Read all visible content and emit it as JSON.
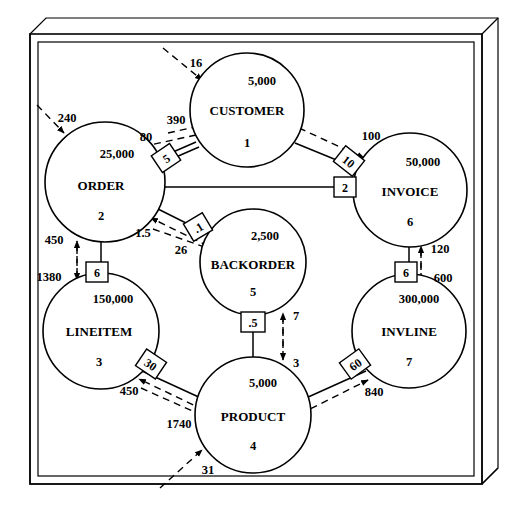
{
  "diagram": {
    "type": "entity-relationship-volume-diagram",
    "nodes": [
      {
        "id": "customer",
        "name": "CUSTOMER",
        "count": "5,000",
        "number": "1",
        "cx": 247,
        "cy": 110,
        "r": 57
      },
      {
        "id": "order",
        "name": "ORDER",
        "count": "25,000",
        "number": "2",
        "cx": 105,
        "cy": 182,
        "r": 60
      },
      {
        "id": "invoice",
        "name": "INVOICE",
        "count": "50,000",
        "number": "6",
        "cx": 410,
        "cy": 190,
        "r": 57
      },
      {
        "id": "backorder",
        "name": "BACKORDER",
        "count": "2,500",
        "number": "5",
        "cx": 253,
        "cy": 262,
        "r": 53
      },
      {
        "id": "lineitem",
        "name": "LINEITEM",
        "count": "150,000",
        "number": "3",
        "cx": 101,
        "cy": 331,
        "r": 58
      },
      {
        "id": "invline",
        "name": "INVLINE",
        "count": "300,000",
        "number": "7",
        "cx": 409,
        "cy": 331,
        "r": 57
      },
      {
        "id": "product",
        "name": "PRODUCT",
        "count": "5,000",
        "number": "4",
        "cx": 253,
        "cy": 415,
        "r": 58
      }
    ],
    "cardinality_boxes": [
      {
        "id": "order-customer",
        "label": "5",
        "x": 166,
        "y": 158,
        "rot": -34
      },
      {
        "id": "customer-invoice",
        "label": "10",
        "x": 349,
        "y": 161,
        "rot": 38
      },
      {
        "id": "order-invoice",
        "label": "2",
        "x": 345,
        "y": 186,
        "rot": 0
      },
      {
        "id": "order-backorder",
        "label": ".1",
        "x": 198,
        "y": 227,
        "rot": -31
      },
      {
        "id": "order-lineitem",
        "label": "6",
        "x": 97,
        "y": 272,
        "rot": 0
      },
      {
        "id": "invoice-invline",
        "label": "6",
        "x": 406,
        "y": 272,
        "rot": 0
      },
      {
        "id": "backorder-product",
        "label": ".5",
        "x": 253,
        "y": 322,
        "rot": 0
      },
      {
        "id": "lineitem-product",
        "label": "30",
        "x": 151,
        "y": 364,
        "rot": 34
      },
      {
        "id": "product-invline",
        "label": "60",
        "x": 355,
        "y": 364,
        "rot": -36
      }
    ],
    "flow_labels": [
      {
        "id": "ext-customer",
        "value": "16",
        "x": 196,
        "y": 62
      },
      {
        "id": "ext-order",
        "value": "240",
        "x": 67,
        "y": 118
      },
      {
        "id": "customer-to-order",
        "value": "390",
        "x": 176,
        "y": 120
      },
      {
        "id": "order-to-customer",
        "value": "80",
        "x": 146,
        "y": 137
      },
      {
        "id": "customer-to-invoice",
        "value": "100",
        "x": 371,
        "y": 136
      },
      {
        "id": "backorder-to-order",
        "value": "1.5",
        "x": 143,
        "y": 233
      },
      {
        "id": "order-to-backorder",
        "value": "26",
        "x": 181,
        "y": 250
      },
      {
        "id": "lineitem-to-order",
        "value": "450",
        "x": 48,
        "y": 240
      },
      {
        "id": "order-to-lineitem",
        "value": "1380",
        "x": 45,
        "y": 277
      },
      {
        "id": "invline-to-invoice",
        "value": "120",
        "x": 427,
        "y": 249
      },
      {
        "id": "invoice-to-invline",
        "value": "600",
        "x": 428,
        "y": 278
      },
      {
        "id": "product-to-backorder",
        "value": "7",
        "x": 292,
        "y": 316
      },
      {
        "id": "backorder-to-product",
        "value": "3",
        "x": 292,
        "y": 363
      },
      {
        "id": "product-to-lineitem",
        "value": "450",
        "x": 129,
        "y": 391
      },
      {
        "id": "lineitem-to-product",
        "value": "1740",
        "x": 176,
        "y": 424
      },
      {
        "id": "product-to-invline",
        "value": "840",
        "x": 370,
        "y": 392
      },
      {
        "id": "ext-product",
        "value": "31",
        "x": 208,
        "y": 470
      }
    ]
  }
}
